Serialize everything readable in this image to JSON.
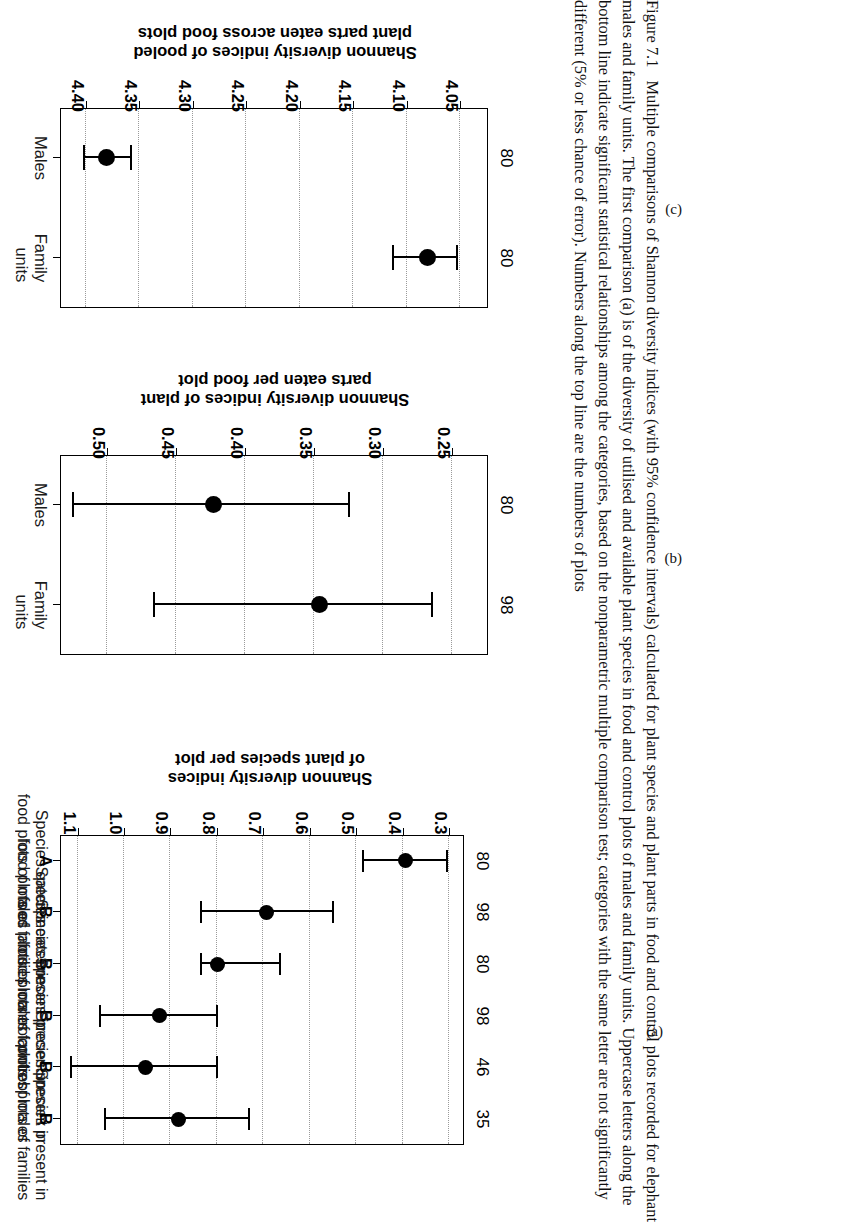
{
  "figure": {
    "caption_number": "Figure 7.1",
    "caption_text": "Multiple comparisons of Shannon diversity indices (with 95% confidence intervals) calculated for plant species and plant parts in food and control plots recorded for elephant males and family units. The first comparison (a) is of the diversity of utilised and available plant species in food and control plots of males and family units. Uppercase letters along the bottom line indicate significant statistical relationships among the categories, based on the nonparametric multiple comparison test; categories with the same letter are not significantly different (5% or less chance of error). Numbers along the top line are the numbers of plots",
    "panel_letters": {
      "a": "(a)",
      "b": "(b)",
      "c": "(c)"
    }
  },
  "chart_data": [
    {
      "panel": "(a)",
      "type": "scatter",
      "orientation": "horizontal-errorbar",
      "title": "",
      "xlabel": "Shannon diversity indices of plant species per plot",
      "ylabel": "",
      "xlim": [
        0.27,
        1.14
      ],
      "xticks": [
        "0.3",
        "0.4",
        "0.5",
        "0.6",
        "0.7",
        "0.8",
        "0.9",
        "1.0",
        "1.1"
      ],
      "xtickvalues": [
        0.3,
        0.4,
        0.5,
        0.6,
        0.7,
        0.8,
        0.9,
        1.0,
        1.1
      ],
      "grid": true,
      "categories": [
        "Species eaten in food plots of males",
        "Species eaten in food plots of families",
        "Species present in food plots of males",
        "Species present in food plots of families",
        "Species present in control plots of males",
        "Species present in control plots of families"
      ],
      "values": [
        0.395,
        0.695,
        0.8,
        0.925,
        0.955,
        0.885
      ],
      "ci_low": [
        0.305,
        0.55,
        0.665,
        0.8,
        0.8,
        0.73
      ],
      "ci_high": [
        0.485,
        0.835,
        0.835,
        1.052,
        1.115,
        1.04
      ],
      "counts": [
        "80",
        "98",
        "80",
        "98",
        "46",
        "35"
      ],
      "letters": [
        "A",
        "B",
        "B",
        "B",
        "B",
        "B"
      ]
    },
    {
      "panel": "(b)",
      "type": "scatter",
      "orientation": "horizontal-errorbar",
      "title": "",
      "xlabel": "Shannon diversity indices of plant parts eaten per food plot",
      "ylabel": "",
      "xlim": [
        0.225,
        0.535
      ],
      "xticks": [
        "0.25",
        "0.30",
        "0.35",
        "0.40",
        "0.45",
        "0.50"
      ],
      "xtickvalues": [
        0.25,
        0.3,
        0.35,
        0.4,
        0.45,
        0.5
      ],
      "grid": true,
      "categories": [
        "Males",
        "Family units"
      ],
      "values": [
        0.424,
        0.347
      ],
      "ci_low": [
        0.325,
        0.265
      ],
      "ci_high": [
        0.525,
        0.466
      ],
      "counts": [
        "80",
        "98"
      ]
    },
    {
      "panel": "(c)",
      "type": "scatter",
      "orientation": "horizontal-errorbar",
      "title": "",
      "xlabel": "Shannon diversity indices of pooled plant parts eaten across food plots",
      "ylabel": "",
      "xlim": [
        4.025,
        4.425
      ],
      "xticks": [
        "4.05",
        "4.10",
        "4.15",
        "4.20",
        "4.25",
        "4.30",
        "4.35",
        "4.40"
      ],
      "xtickvalues": [
        4.05,
        4.1,
        4.15,
        4.2,
        4.25,
        4.3,
        4.35,
        4.4
      ],
      "grid": true,
      "categories": [
        "Males",
        "Family units"
      ],
      "values": [
        4.382,
        4.082
      ],
      "ci_low": [
        4.358,
        4.053
      ],
      "ci_high": [
        4.402,
        4.113
      ],
      "counts": [
        "80",
        "80"
      ]
    }
  ],
  "panel_a": {
    "axis_title_line1": "Shannon diversity indices",
    "axis_title_line2": "of plant species per plot",
    "categories": [
      {
        "line1": "Species eaten in",
        "line2": "food plots of males",
        "count": "80",
        "letter": "A"
      },
      {
        "line1": "Species eaten in",
        "line2": "food plots of families",
        "count": "98",
        "letter": "B"
      },
      {
        "line1": "Species present in",
        "line2": "food plots of males",
        "count": "80",
        "letter": "B"
      },
      {
        "line1": "Species present in",
        "line2": "food plots of families",
        "count": "98",
        "letter": "B"
      },
      {
        "line1": "Species present in",
        "line2": "control plots of males",
        "count": "46",
        "letter": "B"
      },
      {
        "line1": "Species present in",
        "line2": "control plots of families",
        "count": "35",
        "letter": "B"
      }
    ],
    "ticks": [
      "0.3",
      "0.4",
      "0.5",
      "0.6",
      "0.7",
      "0.8",
      "0.9",
      "1.0",
      "1.1"
    ]
  },
  "panel_b": {
    "axis_title_line1": "Shannon diversity indices of plant",
    "axis_title_line2": "parts eaten per food plot",
    "categories": [
      {
        "line1": "Males",
        "line2": "",
        "count": "80"
      },
      {
        "line1": "Family",
        "line2": "units",
        "count": "98"
      }
    ],
    "ticks": [
      "0.25",
      "0.30",
      "0.35",
      "0.40",
      "0.45",
      "0.50"
    ]
  },
  "panel_c": {
    "axis_title_line1": "Shannon diversity indices of pooled",
    "axis_title_line2": "plant parts eaten across food plots",
    "categories": [
      {
        "line1": "Males",
        "line2": "",
        "count": "80"
      },
      {
        "line1": "Family",
        "line2": "units",
        "count": "80"
      }
    ],
    "ticks": [
      "4.05",
      "4.10",
      "4.15",
      "4.20",
      "4.25",
      "4.30",
      "4.35",
      "4.40"
    ]
  }
}
